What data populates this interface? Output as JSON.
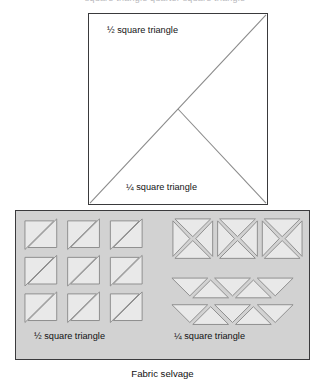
{
  "top_caption": {
    "text": "square triangle  quarter square triangle"
  },
  "unit_square": {
    "label_half": "½  square triangle",
    "label_quarter": "¼  square triangle",
    "border_color": "#3a3a3c",
    "fill_color": "#ffffff",
    "diagonal_color": "#8a8a8a"
  },
  "fabric_panel": {
    "label_half": "½  square triangle",
    "label_quarter": "¼  square triangle",
    "fill_color": "#d2d2d2",
    "border_color": "#3b3b3d",
    "piece_fill": "#e9e9e9",
    "piece_stroke": "#8f8f8f",
    "half_square_group": {
      "rows": 3,
      "cols": 3,
      "piece_type": "half-square-triangle",
      "description": "square with single diagonal from bottom-left to top-right"
    },
    "quarter_square_group": {
      "squares_row": {
        "count": 3,
        "piece_type": "quarter-square-triangle",
        "description": "square with both diagonals forming an X"
      },
      "triangle_rows": [
        {
          "count": 5,
          "orientation": "alternating-down-up",
          "first": "down"
        },
        {
          "count": 5,
          "orientation": "alternating-down-up",
          "first": "down"
        }
      ]
    }
  },
  "selvage_caption": {
    "text": "Fabric selvage"
  }
}
